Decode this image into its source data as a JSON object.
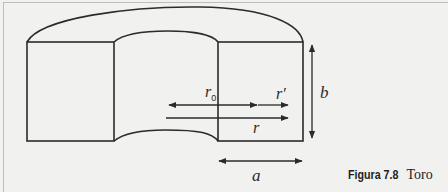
{
  "figure": {
    "caption_label": "Figura 7.8",
    "caption_title": "Toro",
    "labels": {
      "r0_main": "r",
      "r0_sub": "0",
      "r_prime": "r′",
      "r": "r",
      "b": "b",
      "a": "a"
    },
    "colors": {
      "background": "#f1f1f0",
      "stroke": "#2b2b2b",
      "frame": "#bdbdbd"
    }
  }
}
